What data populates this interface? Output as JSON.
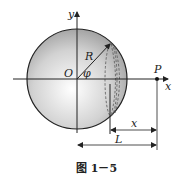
{
  "diagram": {
    "labels": {
      "y_axis": "y",
      "x_axis": "x",
      "origin": "O",
      "radius": "R",
      "angle": "φ",
      "point": "P",
      "dim_x": "x",
      "dim_L": "L"
    },
    "caption": "图 1－5",
    "colors": {
      "sphere_edge": "#222222",
      "sphere_fill_light": "#ffffff",
      "sphere_fill_dark": "#9a9a9a",
      "lines": "#222222",
      "dashed": "#555555"
    }
  }
}
